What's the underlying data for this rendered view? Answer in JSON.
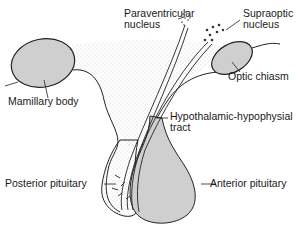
{
  "diagram": {
    "labels": {
      "paraventricular_line1": "Paraventricular",
      "paraventricular_line2": "nucleus",
      "supraoptic_line1": "Supraoptic",
      "supraoptic_line2": "nucleus",
      "mamillary_body": "Mamillary body",
      "optic_chiasm": "Optic chiasm",
      "tract_line1": "Hypothalamic-hypophysial",
      "tract_line2": "tract",
      "posterior_pituitary": "Posterior pituitary",
      "anterior_pituitary": "Anterior pituitary"
    },
    "colors": {
      "structure_fill": "#cfcfcf",
      "stipple": "#9a9a9a",
      "outline": "#222222",
      "background": "#ffffff"
    }
  }
}
